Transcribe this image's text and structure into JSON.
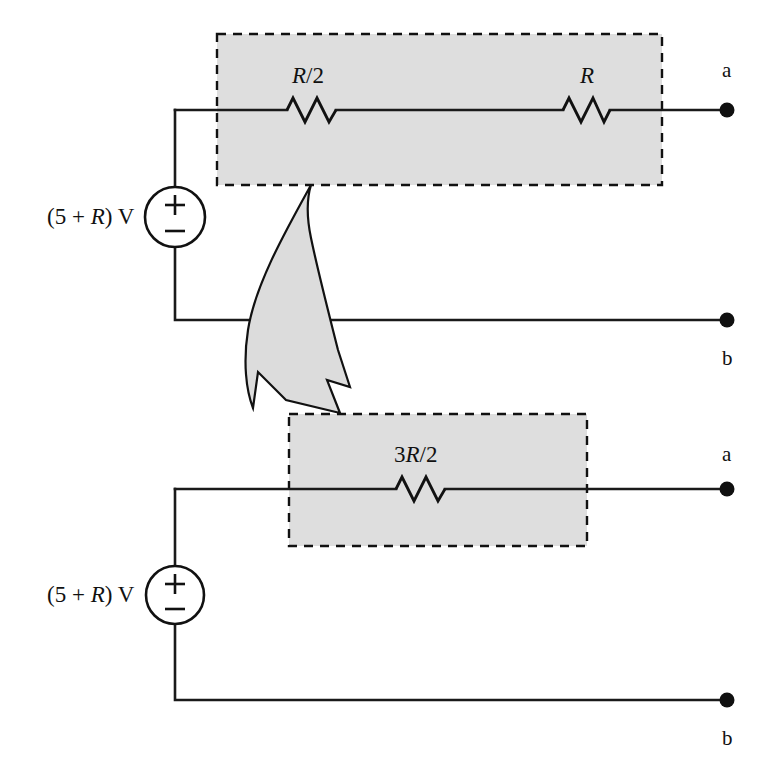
{
  "figure": {
    "background_color": "#ffffff",
    "box_fill_color": "#dedede",
    "line_color": "#111111",
    "arrow_fill_color": "#dcdcdc"
  },
  "top_circuit": {
    "source_label_prefix": "(5 + ",
    "source_label_var": "R",
    "source_label_suffix": ") V",
    "source_plus": "+",
    "source_minus": "−",
    "resistor_1_num": "R",
    "resistor_1_den": "/2",
    "resistor_2": "R",
    "terminal_a": "a",
    "terminal_b": "b"
  },
  "bottom_circuit": {
    "source_label_prefix": "(5 + ",
    "source_label_var": "R",
    "source_label_suffix": ") V",
    "source_plus": "+",
    "source_minus": "−",
    "resistor_coeff": "3",
    "resistor_var": "R",
    "resistor_den": "/2",
    "terminal_a": "a",
    "terminal_b": "b"
  },
  "arrow": {
    "name": "curved-transform-arrow",
    "direction": "down-right"
  }
}
